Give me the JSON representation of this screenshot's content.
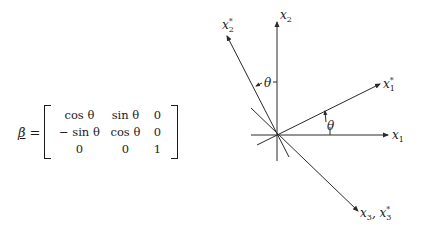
{
  "matrix": {
    "symbol": "β",
    "equals": "=",
    "rows": [
      [
        "cos θ",
        "sin θ",
        "0"
      ],
      [
        "− sin θ",
        "cos θ",
        "0"
      ],
      [
        "0",
        "0",
        "1"
      ]
    ]
  },
  "diagram": {
    "axes": [
      {
        "id": "x1",
        "label": "x",
        "subscript": "1",
        "star": ""
      },
      {
        "id": "x2",
        "label": "x",
        "subscript": "2",
        "star": ""
      },
      {
        "id": "x1_star",
        "label": "x",
        "subscript": "1",
        "star": "*"
      },
      {
        "id": "x2_star",
        "label": "x",
        "subscript": "2",
        "star": "*"
      },
      {
        "id": "x3",
        "label": "x",
        "subscript": "3",
        "star": "",
        "suffix": ", "
      },
      {
        "id": "x3_star",
        "label": "x",
        "subscript": "3",
        "star": "*"
      }
    ],
    "angle_labels": [
      "θ",
      "θ"
    ],
    "line_color": "#2a2a2a"
  }
}
